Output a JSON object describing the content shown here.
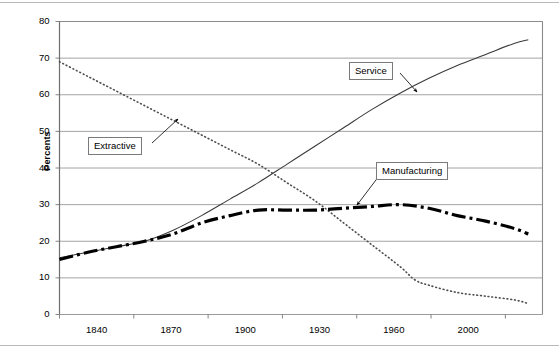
{
  "chart_data": {
    "type": "line",
    "title": "",
    "xlabel": "",
    "ylabel": "Percents",
    "xlim": [
      1840,
      2010
    ],
    "ylim": [
      0,
      80
    ],
    "ytick_step": 10,
    "grid": true,
    "legend_position": "inline-callouts",
    "xticks": [
      "1840",
      "1870",
      "1900",
      "1930",
      "1960",
      "2000"
    ],
    "xtick_values": [
      1840,
      1870,
      1900,
      1930,
      1960,
      2000
    ],
    "yticks": [
      "0",
      "10",
      "20",
      "30",
      "40",
      "50",
      "60",
      "70",
      "80"
    ],
    "ytick_values": [
      0,
      10,
      20,
      30,
      40,
      50,
      60,
      70,
      80
    ],
    "series": [
      {
        "name": "Extractive",
        "style": "dotted",
        "color": "#4d4d4d",
        "x": [
          1840,
          1850,
          1860,
          1870,
          1880,
          1890,
          1900,
          1910,
          1920,
          1930,
          1940,
          1950,
          1960,
          1965,
          1970,
          1980,
          1990,
          2000,
          2005
        ],
        "values": [
          69,
          65,
          61,
          57,
          53,
          49,
          45,
          41,
          36,
          31,
          25,
          19,
          13,
          9.5,
          8,
          6,
          5,
          4,
          3
        ]
      },
      {
        "name": "Service",
        "style": "solid",
        "color": "#3a3a3a",
        "x": [
          1840,
          1850,
          1860,
          1870,
          1880,
          1890,
          1900,
          1910,
          1920,
          1930,
          1940,
          1950,
          1960,
          1970,
          1980,
          1990,
          2000,
          2005
        ],
        "values": [
          15.5,
          17,
          18.5,
          20,
          23,
          27,
          31.5,
          36,
          41,
          46,
          51,
          56,
          60.5,
          64.5,
          68,
          71,
          74,
          75
        ]
      },
      {
        "name": "Manufacturing",
        "style": "dash-dot",
        "color": "#000000",
        "x": [
          1840,
          1850,
          1860,
          1870,
          1880,
          1890,
          1900,
          1910,
          1920,
          1930,
          1940,
          1950,
          1960,
          1970,
          1980,
          1990,
          2000,
          2005
        ],
        "values": [
          15,
          17,
          18.5,
          20,
          22,
          25,
          27,
          28.5,
          28.5,
          28.5,
          29,
          29.5,
          30,
          29,
          27,
          25.5,
          23.5,
          22
        ]
      }
    ],
    "annotations": [
      {
        "label": "Extractive",
        "box_x": 88,
        "box_y": 137,
        "target_x": 178,
        "target_y": 119
      },
      {
        "label": "Service",
        "box_x": 349,
        "box_y": 62,
        "target_x": 417,
        "target_y": 92
      },
      {
        "label": "Manufacturing",
        "box_x": 376,
        "box_y": 162,
        "target_x": 357,
        "target_y": 205
      }
    ]
  },
  "axis": {
    "ylabel": "Percents"
  }
}
